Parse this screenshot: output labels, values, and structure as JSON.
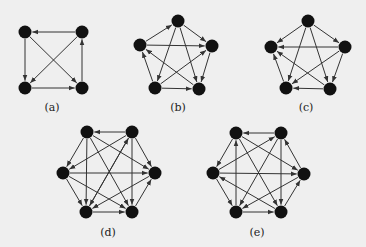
{
  "figure": {
    "background": "#efefef",
    "node_color": "#111111",
    "edge_color": "#333333",
    "node_radius": 6.5,
    "panels": [
      {
        "id": "a",
        "label": "(a)",
        "label_pos": [
          52,
          107
        ],
        "nodes": {
          "TL": [
            25,
            32
          ],
          "TR": [
            82,
            32
          ],
          "BL": [
            25,
            88
          ],
          "BR": [
            82,
            88
          ]
        },
        "edges": [
          [
            "TR",
            "TL"
          ],
          [
            "TL",
            "BL"
          ],
          [
            "BL",
            "BR"
          ],
          [
            "BR",
            "TR"
          ],
          [
            "TL",
            "BR"
          ],
          [
            "TR",
            "BL"
          ]
        ]
      },
      {
        "id": "b",
        "label": "(b)",
        "label_pos": [
          178,
          107
        ],
        "nodes": {
          "T": [
            178,
            21
          ],
          "L": [
            140,
            45
          ],
          "R": [
            212,
            46
          ],
          "BL": [
            155,
            88
          ],
          "BR": [
            199,
            89
          ]
        },
        "edges": [
          [
            "L",
            "T"
          ],
          [
            "T",
            "R"
          ],
          [
            "L",
            "R"
          ],
          [
            "R",
            "BR"
          ],
          [
            "BL",
            "BR"
          ],
          [
            "BL",
            "L"
          ],
          [
            "T",
            "BL"
          ],
          [
            "T",
            "BR"
          ],
          [
            "BR",
            "L"
          ],
          [
            "BL",
            "R"
          ]
        ]
      },
      {
        "id": "c",
        "label": "(c)",
        "label_pos": [
          306,
          107
        ],
        "nodes": {
          "T": [
            308,
            21
          ],
          "L": [
            271,
            47
          ],
          "R": [
            345,
            47
          ],
          "BL": [
            286,
            88
          ],
          "BR": [
            330,
            89
          ]
        },
        "edges": [
          [
            "T",
            "L"
          ],
          [
            "T",
            "R"
          ],
          [
            "R",
            "L"
          ],
          [
            "BL",
            "L"
          ],
          [
            "T",
            "BL"
          ],
          [
            "T",
            "BR"
          ],
          [
            "R",
            "BR"
          ],
          [
            "BR",
            "BL"
          ],
          [
            "BR",
            "L"
          ],
          [
            "R",
            "BL"
          ]
        ]
      },
      {
        "id": "d",
        "label": "(d)",
        "label_pos": [
          108,
          232
        ],
        "nodes": {
          "TL": [
            87,
            132
          ],
          "TR": [
            132,
            132
          ],
          "L": [
            63,
            173
          ],
          "R": [
            155,
            173
          ],
          "BL": [
            86,
            212
          ],
          "BR": [
            132,
            212
          ]
        },
        "edges": [
          [
            "TR",
            "TL"
          ],
          [
            "TL",
            "L"
          ],
          [
            "TR",
            "L"
          ],
          [
            "TR",
            "R"
          ],
          [
            "TL",
            "R"
          ],
          [
            "BL",
            "TR"
          ],
          [
            "L",
            "R"
          ],
          [
            "L",
            "BL"
          ],
          [
            "L",
            "BR"
          ],
          [
            "TL",
            "BL"
          ],
          [
            "TR",
            "BL"
          ],
          [
            "R",
            "BL"
          ],
          [
            "BL",
            "BR"
          ],
          [
            "TL",
            "BR"
          ],
          [
            "TR",
            "BR"
          ],
          [
            "BR",
            "R"
          ]
        ]
      },
      {
        "id": "e",
        "label": "(e)",
        "label_pos": [
          257,
          232
        ],
        "nodes": {
          "TL": [
            236,
            133
          ],
          "TR": [
            281,
            133
          ],
          "L": [
            213,
            173
          ],
          "R": [
            304,
            174
          ],
          "BL": [
            236,
            212
          ],
          "BR": [
            281,
            212
          ]
        },
        "edges": [
          [
            "TR",
            "TL"
          ],
          [
            "TL",
            "L"
          ],
          [
            "L",
            "TR"
          ],
          [
            "TL",
            "R"
          ],
          [
            "R",
            "TR"
          ],
          [
            "BL",
            "TL"
          ],
          [
            "L",
            "R"
          ],
          [
            "L",
            "BL"
          ],
          [
            "BR",
            "L"
          ],
          [
            "R",
            "BL"
          ],
          [
            "BL",
            "BR"
          ],
          [
            "BR",
            "R"
          ],
          [
            "TR",
            "BR"
          ],
          [
            "TL",
            "BR"
          ],
          [
            "TR",
            "BL"
          ]
        ]
      }
    ]
  }
}
